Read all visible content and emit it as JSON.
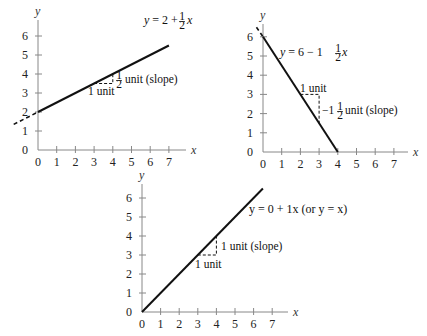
{
  "chart_data": [
    {
      "type": "line",
      "title": "",
      "equation_label": "y = 2 + ½x",
      "equation": {
        "intercept": 2,
        "slope": 0.5
      },
      "xlabel": "x",
      "ylabel": "y",
      "x_ticks": [
        0,
        1,
        2,
        3,
        4,
        5,
        6,
        7
      ],
      "y_ticks": [
        0,
        1,
        2,
        3,
        4,
        5,
        6
      ],
      "xlim": [
        0,
        7
      ],
      "ylim": [
        0,
        6
      ],
      "series": [
        {
          "name": "y = 2 + ½x",
          "x": [
            0,
            7
          ],
          "y": [
            2,
            5.5
          ]
        }
      ],
      "dashed_extension": {
        "x": [
          -1.3,
          0
        ],
        "y": [
          1.35,
          2
        ]
      },
      "slope_triangle": {
        "run_from_x": 3,
        "run_to_x": 4,
        "base_y": 3.5,
        "rise_to_y": 4
      },
      "annotations": {
        "run": "1 unit",
        "rise": "½ unit (slope)"
      }
    },
    {
      "type": "line",
      "title": "",
      "equation_label": "y = 6 − 1½x",
      "equation": {
        "intercept": 6,
        "slope": -1.5
      },
      "xlabel": "x",
      "ylabel": "y",
      "x_ticks": [
        0,
        1,
        2,
        3,
        4,
        5,
        6,
        7
      ],
      "y_ticks": [
        0,
        1,
        2,
        3,
        4,
        5,
        6
      ],
      "xlim": [
        0,
        7
      ],
      "ylim": [
        0,
        6
      ],
      "series": [
        {
          "name": "y = 6 − 1½x",
          "x": [
            0,
            4
          ],
          "y": [
            6,
            0
          ]
        }
      ],
      "dashed_extension": {
        "x": [
          -0.35,
          0
        ],
        "y": [
          6.5,
          6
        ]
      },
      "slope_triangle": {
        "run_from_x": 2,
        "run_to_x": 3,
        "base_y": 3,
        "rise_to_y": 1.5
      },
      "annotations": {
        "run": "1 unit",
        "rise": "−1½ unit (slope)"
      }
    },
    {
      "type": "line",
      "title": "",
      "equation_label": "y = 0 + 1x (or y = x)",
      "equation": {
        "intercept": 0,
        "slope": 1
      },
      "xlabel": "x",
      "ylabel": "y",
      "x_ticks": [
        0,
        1,
        2,
        3,
        4,
        5,
        6,
        7
      ],
      "y_ticks": [
        0,
        1,
        2,
        3,
        4,
        5,
        6
      ],
      "xlim": [
        0,
        7
      ],
      "ylim": [
        0,
        6
      ],
      "series": [
        {
          "name": "y = x",
          "x": [
            0,
            6.5
          ],
          "y": [
            0,
            6.5
          ]
        }
      ],
      "slope_triangle": {
        "run_from_x": 3,
        "run_to_x": 4,
        "base_y": 3,
        "rise_to_y": 4
      },
      "annotations": {
        "run": "1 unit",
        "rise": "1 unit (slope)"
      }
    }
  ],
  "labels": {
    "c1": {
      "eq_prefix": "y = 2 + ",
      "eq_frac_num": "1",
      "eq_frac_den": "2",
      "eq_suffix": "x",
      "run": "1 unit",
      "rise_frac_num": "1",
      "rise_frac_den": "2",
      "rise_text": "unit (slope)"
    },
    "c2": {
      "eq_prefix": "y = 6 − 1",
      "eq_frac_num": "1",
      "eq_frac_den": "2",
      "eq_suffix": "x",
      "run": "1 unit",
      "rise_prefix": "−1",
      "rise_frac_num": "1",
      "rise_frac_den": "2",
      "rise_text": "unit (slope)"
    },
    "c3": {
      "eq": "y = 0 + 1x (or y = x)",
      "run": "1 unit",
      "rise": "1 unit (slope)"
    }
  },
  "axis_names": {
    "x": "x",
    "y": "y"
  },
  "tick_labels": {
    "x": [
      "0",
      "1",
      "2",
      "3",
      "4",
      "5",
      "6",
      "7"
    ],
    "y": [
      "0",
      "1",
      "2",
      "3",
      "4",
      "5",
      "6"
    ]
  }
}
